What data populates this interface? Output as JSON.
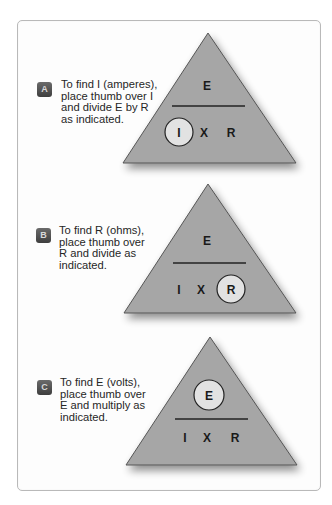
{
  "diagram": {
    "colors": {
      "triangle_fill": "#a6a6a6",
      "triangle_stroke": "#555555",
      "circle_fill": "#e2e2e2",
      "badge_fill": "#4a4a4a",
      "text": "#262626"
    },
    "panels": [
      {
        "badge": "A",
        "caption_lines": [
          "To find I (amperes),",
          "place thumb over I",
          "and divide E by R",
          "as indicated."
        ],
        "top_label": "E",
        "bottom_labels": [
          "I",
          "X",
          "R"
        ],
        "circled": "I"
      },
      {
        "badge": "B",
        "caption_lines": [
          "To find R (ohms),",
          "place thumb over",
          "R and divide as",
          "indicated."
        ],
        "top_label": "E",
        "bottom_labels": [
          "I",
          "X",
          "R"
        ],
        "circled": "R"
      },
      {
        "badge": "C",
        "caption_lines": [
          "To find E (volts),",
          "place thumb over",
          "E and multiply as",
          "indicated."
        ],
        "top_label": "E",
        "bottom_labels": [
          "I",
          "X",
          "R"
        ],
        "circled": "E"
      }
    ]
  }
}
